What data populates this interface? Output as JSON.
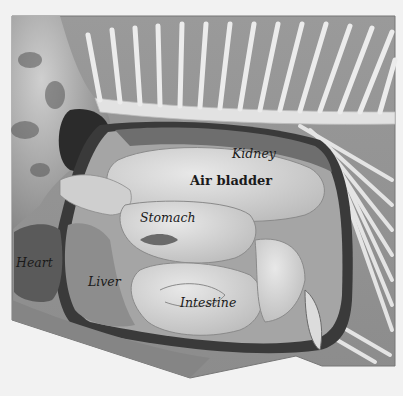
{
  "diagram": {
    "labels": {
      "kidney": "Kidney",
      "air_bladder": "Air bladder",
      "stomach": "Stomach",
      "heart": "Heart",
      "liver": "Liver",
      "intestine": "Intestine"
    },
    "colors": {
      "background": "#f2f2f2",
      "body_wall": "#8a8a8a",
      "cavity_lining": "#3a3a3a",
      "organ_light": "#d8d8d8",
      "organ_mid": "#b5b5b5",
      "bone": "#e6e6e6"
    }
  }
}
